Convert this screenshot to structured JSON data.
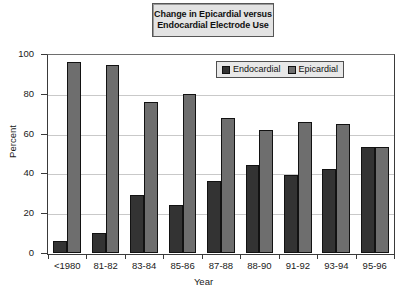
{
  "chart_data": {
    "type": "bar",
    "title": "Change in Epicardial versus Endocardial Electrode Use",
    "title_lines": [
      "Change in Epicardial versus",
      "Endocardial Electrode Use"
    ],
    "xlabel": "Year",
    "ylabel": "Percent",
    "ylim": [
      0,
      100
    ],
    "ytick_labels": [
      "0",
      "20",
      "40",
      "60",
      "80",
      "100"
    ],
    "yticks": [
      0,
      20,
      40,
      60,
      80,
      100
    ],
    "grid": "horizontal",
    "legend_position": "upper-right-inside",
    "categories": [
      "<1980",
      "81-82",
      "83-84",
      "85-86",
      "87-88",
      "88-90",
      "91-92",
      "93-94",
      "95-96"
    ],
    "series": [
      {
        "name": "Endocardial",
        "color": "#333333",
        "values": [
          6,
          10,
          29,
          24,
          36,
          44,
          39,
          42,
          53.5
        ]
      },
      {
        "name": "Epicardial",
        "color": "#6e6e6e",
        "values": [
          96,
          94.5,
          76,
          80,
          68,
          62,
          66,
          65,
          53.5
        ]
      }
    ]
  },
  "colors": {
    "endocardial": "#333333",
    "epicardial": "#6e6e6e",
    "axis": "#3a3a3a",
    "gridline": "#c9c9c9",
    "title_box_fill": "#e3e3e3",
    "legend_box_fill": "#e8e8e8",
    "background": "#ffffff"
  }
}
